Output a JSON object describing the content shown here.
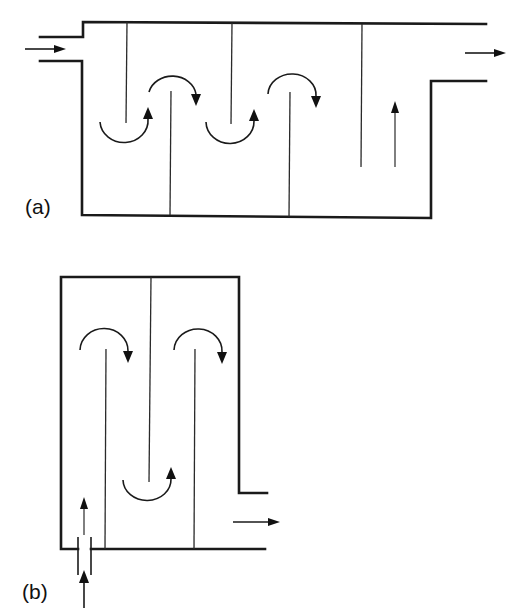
{
  "figure": {
    "panels": [
      {
        "id": "a",
        "label": "(a)",
        "description": "Horizontal baffled tank with over-and-under baffles; inlet at upper left, outlet at upper right",
        "flow_direction": "left-to-right",
        "inlet": "left side, upper",
        "outlet": "right side, upper",
        "baffles_from_top": 3,
        "baffles_from_bottom": 2,
        "flow_arrows": [
          "inlet-right",
          "u-turn-up",
          "over-turn-down",
          "u-turn-up",
          "over-turn-down",
          "straight-up",
          "outlet-right"
        ]
      },
      {
        "id": "b",
        "label": "(b)",
        "description": "Vertical baffled tank; inlet through bottom pipe at left, outlet at lower right",
        "flow_direction": "bottom-left to right",
        "inlet": "bottom, left",
        "outlet": "right side, lower",
        "baffles_from_top": 1,
        "baffles_from_bottom": 2,
        "flow_arrows": [
          "inlet-up",
          "straight-up",
          "over-turn-down",
          "u-turn-up",
          "over-turn-down",
          "outlet-right"
        ]
      }
    ],
    "colors": {
      "line": "#1a1a1a",
      "background": "#ffffff"
    }
  }
}
